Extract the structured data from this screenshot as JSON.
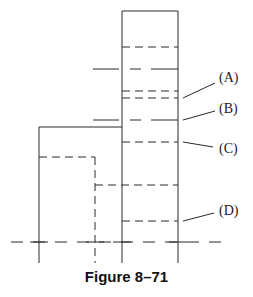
{
  "figure": {
    "caption": "Figure 8–71",
    "labels": {
      "a": "(A)",
      "b": "(B)",
      "c": "(C)",
      "d": "(D)"
    }
  }
}
